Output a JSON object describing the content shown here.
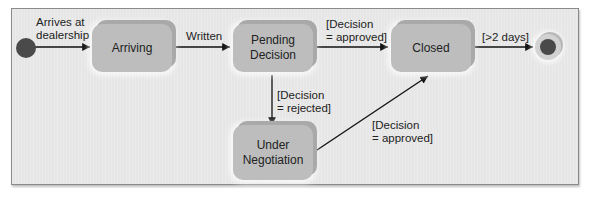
{
  "diagram": {
    "type": "uml-state-diagram",
    "states": [
      {
        "id": "arriving",
        "label": "Arriving"
      },
      {
        "id": "pending",
        "label": "Pending\nDecision",
        "line1": "Pending",
        "line2": "Decision"
      },
      {
        "id": "closed",
        "label": "Closed"
      },
      {
        "id": "negotiation",
        "label": "Under\nNegotiation",
        "line1": "Under",
        "line2": "Negotiation"
      }
    ],
    "transitions": [
      {
        "from": "initial",
        "to": "arriving",
        "line1": "Arrives at",
        "line2": "dealership"
      },
      {
        "from": "arriving",
        "to": "pending",
        "label": "Written"
      },
      {
        "from": "pending",
        "to": "closed",
        "line1": "[Decision",
        "line2": "= approved]"
      },
      {
        "from": "pending",
        "to": "negotiation",
        "line1": "[Decision",
        "line2": "= rejected]"
      },
      {
        "from": "negotiation",
        "to": "closed",
        "line1": "[Decision",
        "line2": "= approved]"
      },
      {
        "from": "closed",
        "to": "final",
        "label": "[>2 days]"
      }
    ],
    "colors": {
      "panel": "#e6e6e6",
      "state": "#bdbdbd",
      "node": "#4a4a4a",
      "line": "#111111"
    }
  }
}
